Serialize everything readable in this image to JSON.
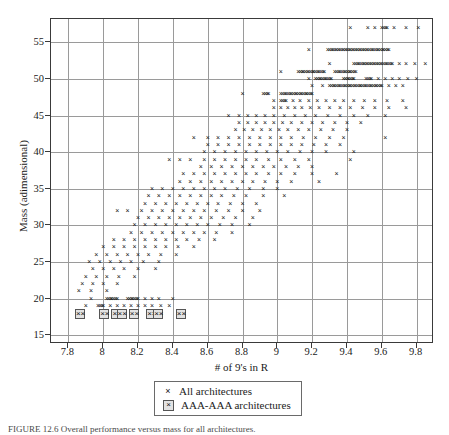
{
  "figure": {
    "caption": "FIGURE 12.6   Overall performance versus mass for all architectures."
  },
  "axes": {
    "x": {
      "label": "# of 9's in R",
      "ticks": [
        7.8,
        8,
        8.2,
        8.4,
        8.6,
        8.8,
        9,
        9.2,
        9.4,
        9.6,
        9.8
      ],
      "tick_labels": [
        "7.8",
        "8",
        "8.2",
        "8.4",
        "8.6",
        "8.8",
        "9",
        "9.2",
        "9.4",
        "9.6",
        "9.8"
      ],
      "min": 7.7,
      "max": 9.9
    },
    "y": {
      "label": "Mass (adimensional)",
      "ticks": [
        15,
        20,
        25,
        30,
        35,
        40,
        45,
        50,
        55
      ],
      "tick_labels": [
        "15",
        "20",
        "25",
        "30",
        "35",
        "40",
        "45",
        "50",
        "55"
      ],
      "min": 13.8,
      "max": 58.2
    },
    "grid": true
  },
  "legend": {
    "position": "below-axis",
    "entries": [
      {
        "symbol": "x-marker",
        "label": "All architectures"
      },
      {
        "symbol": "boxed-x-marker",
        "label": "AAA-AAA architectures"
      }
    ]
  },
  "colors": {
    "marker": "#111111",
    "boxed_marker_fill": "#e2e2e2",
    "boxed_marker_border": "#555555",
    "grid": "#9a9a9a",
    "frame": "#3a3a3a",
    "background": "#ffffff"
  },
  "chart_data": {
    "type": "scatter",
    "title": "",
    "xlabel": "# of 9's in R",
    "ylabel": "Mass (adimensional)",
    "xlim": [
      7.7,
      9.9
    ],
    "ylim": [
      13.8,
      58.2
    ],
    "grid": true,
    "series": [
      {
        "name": "All architectures",
        "marker": "x",
        "note": "Points lie on integer mass rows; each row is a list of x-values (# of 9's in R) occupied at that mass.",
        "rows": [
          {
            "mass": 57,
            "x": [
              9.42,
              9.52,
              9.56,
              9.6,
              9.63,
              9.67,
              9.74,
              9.81
            ]
          },
          {
            "mass": 54,
            "x": [
              9.18,
              9.29,
              9.32,
              9.34,
              9.36,
              9.38,
              9.4,
              9.42,
              9.44,
              9.46,
              9.48,
              9.5,
              9.52,
              9.55,
              9.58,
              9.61,
              9.64
            ]
          },
          {
            "mass": 52,
            "x": [
              9.3,
              9.44,
              9.47,
              9.5,
              9.52,
              9.54,
              9.56,
              9.58,
              9.6,
              9.63,
              9.66,
              9.7,
              9.74,
              9.79,
              9.85
            ]
          },
          {
            "mass": 51,
            "x": [
              9.02,
              9.12,
              9.15,
              9.18,
              9.21,
              9.24,
              9.27,
              9.33,
              9.36,
              9.39,
              9.42,
              9.45
            ]
          },
          {
            "mass": 50,
            "x": [
              9.18,
              9.22,
              9.25,
              9.28,
              9.31,
              9.38,
              9.41,
              9.44,
              9.51,
              9.54,
              9.58,
              9.62,
              9.66,
              9.7,
              9.75,
              9.8
            ]
          },
          {
            "mass": 49,
            "x": [
              9.2,
              9.26,
              9.3,
              9.33,
              9.36,
              9.39,
              9.42,
              9.45,
              9.48,
              9.51,
              9.54,
              9.57,
              9.6,
              9.64,
              9.68,
              9.72
            ]
          },
          {
            "mass": 48,
            "x": [
              8.8,
              8.92,
              8.95,
              9.02,
              9.05,
              9.08,
              9.11,
              9.14,
              9.17,
              9.2
            ]
          },
          {
            "mass": 47,
            "x": [
              8.98,
              9.02,
              9.05,
              9.09,
              9.13,
              9.18,
              9.23,
              9.28,
              9.33,
              9.38,
              9.44,
              9.5,
              9.56,
              9.63,
              9.72
            ]
          },
          {
            "mass": 46,
            "x": [
              8.98,
              9.02,
              9.06,
              9.1,
              9.14,
              9.19,
              9.24,
              9.3,
              9.36,
              9.42,
              9.49,
              9.56,
              9.64,
              9.74
            ]
          },
          {
            "mass": 45,
            "x": [
              8.72,
              8.78,
              8.83,
              8.88,
              8.93,
              8.98,
              9.04,
              9.1,
              9.16,
              9.22,
              9.29,
              9.36,
              9.44,
              9.52,
              9.62
            ]
          },
          {
            "mass": 44,
            "x": [
              8.78,
              8.83,
              8.88,
              8.93,
              8.98,
              9.03,
              9.08,
              9.14,
              9.2,
              9.26,
              9.33,
              9.4,
              9.48
            ]
          },
          {
            "mass": 43,
            "x": [
              8.76,
              8.81,
              8.86,
              8.91,
              8.96,
              9.01,
              9.06,
              9.12,
              9.18,
              9.25,
              9.32,
              9.4
            ]
          },
          {
            "mass": 42,
            "x": [
              8.52,
              8.6,
              8.66,
              8.72,
              8.78,
              8.84,
              8.9,
              8.96,
              9.02,
              9.08,
              9.15,
              9.22,
              9.3,
              9.38,
              9.62
            ]
          },
          {
            "mass": 41,
            "x": [
              8.6,
              8.66,
              8.72,
              8.78,
              8.84,
              8.9,
              8.96,
              9.02,
              9.08,
              9.14,
              9.21,
              9.28,
              9.36
            ]
          },
          {
            "mass": 40,
            "x": [
              8.58,
              8.64,
              8.7,
              8.76,
              8.82,
              8.88,
              8.94,
              9.0,
              9.06,
              9.13,
              9.2,
              9.28,
              9.44
            ]
          },
          {
            "mass": 39,
            "x": [
              8.38,
              8.44,
              8.5,
              8.58,
              8.64,
              8.7,
              8.76,
              8.82,
              8.88,
              8.95,
              9.02,
              9.1,
              9.18,
              9.42
            ]
          },
          {
            "mass": 38,
            "x": [
              8.56,
              8.62,
              8.68,
              8.74,
              8.8,
              8.86,
              8.92,
              8.98,
              9.05,
              9.12,
              9.2
            ]
          },
          {
            "mass": 37,
            "x": [
              8.46,
              8.52,
              8.58,
              8.64,
              8.7,
              8.76,
              8.82,
              8.88,
              8.95,
              9.02,
              9.1,
              9.2,
              9.34
            ]
          },
          {
            "mass": 36,
            "x": [
              8.44,
              8.5,
              8.56,
              8.62,
              8.68,
              8.74,
              8.8,
              8.86,
              8.93,
              9.0,
              9.08,
              9.24
            ]
          },
          {
            "mass": 35,
            "x": [
              8.28,
              8.34,
              8.4,
              8.46,
              8.52,
              8.58,
              8.64,
              8.7,
              8.77,
              8.84,
              8.92,
              9.0
            ]
          },
          {
            "mass": 34,
            "x": [
              8.26,
              8.32,
              8.38,
              8.44,
              8.5,
              8.56,
              8.62,
              8.68,
              8.75,
              8.82,
              8.92,
              9.04
            ]
          },
          {
            "mass": 33,
            "x": [
              8.24,
              8.3,
              8.36,
              8.42,
              8.48,
              8.54,
              8.6,
              8.66,
              8.73,
              8.8,
              8.88
            ]
          },
          {
            "mass": 32,
            "x": [
              8.08,
              8.14,
              8.22,
              8.28,
              8.34,
              8.4,
              8.46,
              8.52,
              8.58,
              8.65,
              8.72,
              8.8,
              8.9
            ]
          },
          {
            "mass": 31,
            "x": [
              8.2,
              8.26,
              8.32,
              8.38,
              8.44,
              8.5,
              8.56,
              8.62,
              8.69,
              8.76,
              8.86
            ]
          },
          {
            "mass": 30,
            "x": [
              8.18,
              8.24,
              8.3,
              8.36,
              8.42,
              8.48,
              8.54,
              8.6,
              8.67,
              8.74,
              8.84
            ]
          },
          {
            "mass": 29,
            "x": [
              8.16,
              8.22,
              8.28,
              8.34,
              8.4,
              8.46,
              8.52,
              8.58,
              8.65,
              8.74
            ]
          },
          {
            "mass": 28,
            "x": [
              8.06,
              8.12,
              8.18,
              8.24,
              8.3,
              8.36,
              8.42,
              8.48,
              8.55,
              8.64
            ]
          },
          {
            "mass": 27,
            "x": [
              8.0,
              8.06,
              8.12,
              8.18,
              8.24,
              8.3,
              8.36,
              8.43,
              8.52
            ]
          },
          {
            "mass": 26,
            "x": [
              7.96,
              8.02,
              8.08,
              8.14,
              8.2,
              8.26,
              8.33,
              8.42
            ]
          },
          {
            "mass": 25,
            "x": [
              7.92,
              7.98,
              8.04,
              8.1,
              8.16,
              8.23,
              8.32
            ]
          },
          {
            "mass": 24,
            "x": [
              7.94,
              8.0,
              8.06,
              8.12,
              8.2,
              8.3
            ]
          },
          {
            "mass": 23,
            "x": [
              7.9,
              7.96,
              8.02,
              8.09,
              8.18
            ]
          },
          {
            "mass": 22,
            "x": [
              7.88,
              7.94,
              8.0,
              8.08
            ]
          },
          {
            "mass": 21,
            "x": [
              7.86,
              7.93,
              8.02
            ]
          },
          {
            "mass": 20,
            "x": [
              7.93,
              8.02,
              8.05,
              8.08,
              8.14,
              8.17,
              8.2,
              8.24,
              8.28,
              8.32,
              8.4
            ]
          },
          {
            "mass": 19,
            "x": [
              7.9,
              7.97,
              8.0,
              8.04,
              8.08,
              8.12,
              8.16,
              8.2,
              8.24,
              8.28,
              8.33,
              8.38
            ]
          }
        ]
      },
      {
        "name": "AAA-AAA architectures",
        "marker": "boxed-x",
        "rows": [
          {
            "mass": 18,
            "x": [
              7.86,
              8.0,
              8.07,
              8.1,
              8.17,
              8.27,
              8.31,
              8.44
            ]
          }
        ]
      }
    ]
  }
}
